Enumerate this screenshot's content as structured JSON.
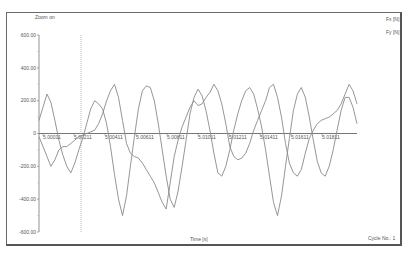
{
  "zoom_label": "Zoom on",
  "legend": [
    {
      "label": "Fx [N]",
      "color": "#8a8a8a"
    },
    {
      "label": "Fy [N]",
      "color": "#8a8a8a"
    }
  ],
  "cycle_label": "Cycle No.: 1",
  "chart_data": {
    "type": "line",
    "title": "",
    "xlabel": "Time [s]",
    "ylabel": "",
    "ylim": [
      -600,
      600
    ],
    "y_ticks": [
      "600.00",
      "400.00",
      "200.00",
      "0",
      "-200.00",
      "-400.00",
      "-600.00"
    ],
    "x_tick_labels": [
      "5.00011",
      "5.00211",
      "5.00411",
      "5.00611",
      "5.00811",
      "5.01011",
      "5.01211",
      "5.01411",
      "5.01611",
      "5.01811"
    ],
    "grid": false,
    "legend_position": "top-right",
    "cursor_line_x": "5.00211",
    "x": [
      0,
      1,
      2,
      3,
      4,
      5,
      6,
      7,
      8,
      9,
      10,
      11,
      12,
      13,
      14,
      15,
      16,
      17,
      18,
      19,
      20,
      21,
      22,
      23,
      24,
      25,
      26,
      27,
      28,
      29,
      30,
      31,
      32,
      33,
      34,
      35,
      36,
      37,
      38,
      39,
      40,
      41,
      42,
      43,
      44,
      45,
      46,
      47,
      48,
      49,
      50,
      51,
      52,
      53,
      54,
      55,
      56,
      57,
      58,
      59,
      60,
      61,
      62,
      63,
      64,
      65,
      66,
      67,
      68,
      69,
      70,
      71,
      72,
      73,
      74,
      75,
      76,
      77,
      78,
      79,
      80
    ],
    "series": [
      {
        "name": "Fx [N]",
        "values": [
          80,
          160,
          240,
          190,
          80,
          -40,
          -130,
          -200,
          -240,
          -180,
          -100,
          -30,
          60,
          150,
          200,
          180,
          150,
          60,
          -80,
          -250,
          -400,
          -500,
          -380,
          -200,
          -20,
          150,
          260,
          290,
          280,
          200,
          60,
          -100,
          -260,
          -400,
          -450,
          -350,
          -200,
          -40,
          120,
          220,
          270,
          230,
          140,
          20,
          -120,
          -240,
          -260,
          -200,
          -100,
          20,
          120,
          200,
          260,
          280,
          240,
          150,
          40,
          -100,
          -260,
          -420,
          -500,
          -380,
          -200,
          -30,
          140,
          240,
          280,
          220,
          100,
          -40,
          -170,
          -240,
          -260,
          -200,
          -100,
          20,
          140,
          220,
          220,
          160,
          60
        ]
      },
      {
        "name": "Fy [N]",
        "values": [
          -20,
          -80,
          -140,
          -200,
          -160,
          -100,
          -80,
          -80,
          -60,
          -40,
          -20,
          -10,
          0,
          10,
          20,
          60,
          120,
          200,
          260,
          300,
          220,
          80,
          -60,
          -120,
          -140,
          -150,
          -180,
          -220,
          -260,
          -300,
          -360,
          -420,
          -460,
          -300,
          -140,
          -40,
          40,
          100,
          160,
          200,
          170,
          180,
          220,
          250,
          300,
          260,
          180,
          60,
          -80,
          -140,
          -160,
          -150,
          -120,
          -60,
          20,
          80,
          140,
          200,
          280,
          300,
          220,
          100,
          -60,
          -180,
          -240,
          -260,
          -220,
          -120,
          -30,
          20,
          60,
          80,
          90,
          100,
          120,
          140,
          180,
          240,
          300,
          260,
          180
        ]
      }
    ]
  }
}
